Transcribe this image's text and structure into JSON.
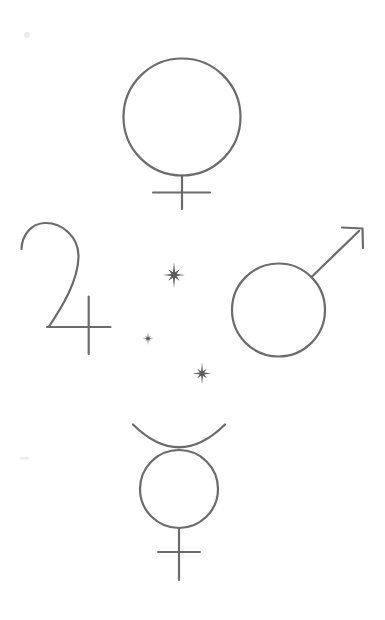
{
  "art": {
    "background": "#ffffff",
    "stroke_color": "#6b6b6b",
    "sparkle_color": "#5c5c5c",
    "artifact_color": "#ececec",
    "symbols": [
      {
        "name": "venus-icon",
        "glyph": "♀",
        "position": "top-center"
      },
      {
        "name": "jupiter-icon",
        "glyph": "♃",
        "position": "middle-left"
      },
      {
        "name": "mars-icon",
        "glyph": "♂",
        "position": "middle-right"
      },
      {
        "name": "mercury-icon",
        "glyph": "☿",
        "position": "bottom-center"
      },
      {
        "name": "sparkle-large-icon",
        "glyph": "✴",
        "position": "center-upper"
      },
      {
        "name": "sparkle-small-icon",
        "glyph": "✴",
        "position": "center-left"
      },
      {
        "name": "sparkle-medium-icon",
        "glyph": "✴",
        "position": "center-lower"
      }
    ]
  }
}
